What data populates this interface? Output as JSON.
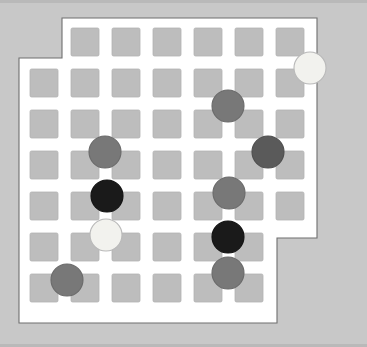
{
  "app": {
    "title": "Board Puzzle",
    "canvas_width": 367,
    "canvas_height": 347,
    "background_color": "#c8c8c8"
  },
  "board": {
    "name": "irregular-grid-board",
    "fill_color": "#ffffff",
    "outline_color": "#6f6f6f",
    "outline_points": "62,18 317,18 317,238 277,238 277,323 19,323 19,58 62,58",
    "cell_fill_color": "#bdbdbd",
    "cell_size": 28,
    "pitch": 41,
    "columns": 7,
    "rows": 7,
    "origin_x": 30,
    "origin_y": 28,
    "cells": [
      {
        "col": 1,
        "row": 0,
        "x": 71,
        "y": 28
      },
      {
        "col": 2,
        "row": 0,
        "x": 112,
        "y": 28
      },
      {
        "col": 3,
        "row": 0,
        "x": 153,
        "y": 28
      },
      {
        "col": 4,
        "row": 0,
        "x": 194,
        "y": 28
      },
      {
        "col": 5,
        "row": 0,
        "x": 235,
        "y": 28
      },
      {
        "col": 6,
        "row": 0,
        "x": 276,
        "y": 28
      },
      {
        "col": 0,
        "row": 1,
        "x": 30,
        "y": 69
      },
      {
        "col": 1,
        "row": 1,
        "x": 71,
        "y": 69
      },
      {
        "col": 2,
        "row": 1,
        "x": 112,
        "y": 69
      },
      {
        "col": 3,
        "row": 1,
        "x": 153,
        "y": 69
      },
      {
        "col": 4,
        "row": 1,
        "x": 194,
        "y": 69
      },
      {
        "col": 5,
        "row": 1,
        "x": 235,
        "y": 69
      },
      {
        "col": 6,
        "row": 1,
        "x": 276,
        "y": 69
      },
      {
        "col": 0,
        "row": 2,
        "x": 30,
        "y": 110
      },
      {
        "col": 1,
        "row": 2,
        "x": 71,
        "y": 110
      },
      {
        "col": 2,
        "row": 2,
        "x": 112,
        "y": 110
      },
      {
        "col": 3,
        "row": 2,
        "x": 153,
        "y": 110
      },
      {
        "col": 4,
        "row": 2,
        "x": 194,
        "y": 110
      },
      {
        "col": 5,
        "row": 2,
        "x": 235,
        "y": 110
      },
      {
        "col": 6,
        "row": 2,
        "x": 276,
        "y": 110
      },
      {
        "col": 0,
        "row": 3,
        "x": 30,
        "y": 151
      },
      {
        "col": 1,
        "row": 3,
        "x": 71,
        "y": 151
      },
      {
        "col": 2,
        "row": 3,
        "x": 112,
        "y": 151
      },
      {
        "col": 3,
        "row": 3,
        "x": 153,
        "y": 151
      },
      {
        "col": 4,
        "row": 3,
        "x": 194,
        "y": 151
      },
      {
        "col": 5,
        "row": 3,
        "x": 235,
        "y": 151
      },
      {
        "col": 6,
        "row": 3,
        "x": 276,
        "y": 151
      },
      {
        "col": 0,
        "row": 4,
        "x": 30,
        "y": 192
      },
      {
        "col": 1,
        "row": 4,
        "x": 71,
        "y": 192
      },
      {
        "col": 2,
        "row": 4,
        "x": 112,
        "y": 192
      },
      {
        "col": 3,
        "row": 4,
        "x": 153,
        "y": 192
      },
      {
        "col": 4,
        "row": 4,
        "x": 194,
        "y": 192
      },
      {
        "col": 5,
        "row": 4,
        "x": 235,
        "y": 192
      },
      {
        "col": 6,
        "row": 4,
        "x": 276,
        "y": 192
      },
      {
        "col": 0,
        "row": 5,
        "x": 30,
        "y": 233
      },
      {
        "col": 1,
        "row": 5,
        "x": 71,
        "y": 233
      },
      {
        "col": 2,
        "row": 5,
        "x": 112,
        "y": 233
      },
      {
        "col": 3,
        "row": 5,
        "x": 153,
        "y": 233
      },
      {
        "col": 4,
        "row": 5,
        "x": 194,
        "y": 233
      },
      {
        "col": 5,
        "row": 5,
        "x": 235,
        "y": 233
      },
      {
        "col": 0,
        "row": 6,
        "x": 30,
        "y": 274
      },
      {
        "col": 1,
        "row": 6,
        "x": 71,
        "y": 274
      },
      {
        "col": 2,
        "row": 6,
        "x": 112,
        "y": 274
      },
      {
        "col": 3,
        "row": 6,
        "x": 153,
        "y": 274
      },
      {
        "col": 4,
        "row": 6,
        "x": 194,
        "y": 274
      },
      {
        "col": 5,
        "row": 6,
        "x": 235,
        "y": 274
      }
    ]
  },
  "pieces": {
    "radius": 16,
    "colors": {
      "gray": "#787878",
      "dark_gray": "#5a5a5a",
      "black": "#1a1a1a",
      "white": "#f2f2ee"
    },
    "items": [
      {
        "id": "piece-white-top-right",
        "color": "white",
        "cx": 310,
        "cy": 68
      },
      {
        "id": "piece-gray-upper-right",
        "color": "gray",
        "cx": 228,
        "cy": 106
      },
      {
        "id": "piece-gray-left-upper",
        "color": "gray",
        "cx": 105,
        "cy": 152
      },
      {
        "id": "piece-dark-gray-right",
        "color": "dark_gray",
        "cx": 268,
        "cy": 152
      },
      {
        "id": "piece-gray-right-mid",
        "color": "gray",
        "cx": 229,
        "cy": 193
      },
      {
        "id": "piece-black-left",
        "color": "black",
        "cx": 107,
        "cy": 196
      },
      {
        "id": "piece-white-left",
        "color": "white",
        "cx": 106,
        "cy": 235
      },
      {
        "id": "piece-black-right",
        "color": "black",
        "cx": 228,
        "cy": 237
      },
      {
        "id": "piece-gray-right-low",
        "color": "gray",
        "cx": 228,
        "cy": 273
      },
      {
        "id": "piece-gray-bottom-left",
        "color": "gray",
        "cx": 67,
        "cy": 280
      }
    ]
  }
}
